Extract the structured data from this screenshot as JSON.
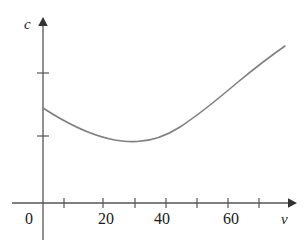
{
  "figure": {
    "width": 304,
    "height": 248,
    "background_color": "#ffffff",
    "axis_color": "#555555",
    "curve_color": "#808080",
    "text_color": "#1a1a1a"
  },
  "labels": {
    "y_axis": "c",
    "x_axis": "v",
    "origin": "0"
  },
  "chart_data": {
    "type": "line",
    "title": "",
    "subtitle": "",
    "xlabel": "v",
    "ylabel": "c",
    "grid": false,
    "legend": null,
    "xlim": [
      0,
      80
    ],
    "ylim": [
      0,
      5
    ],
    "x_ticks": [
      10,
      20,
      30,
      40,
      50,
      60,
      70
    ],
    "x_tick_labels": [
      "",
      "20",
      "",
      "40",
      "",
      "60",
      ""
    ],
    "x_labeled_ticks": [
      {
        "value": 20,
        "label": "20"
      },
      {
        "value": 40,
        "label": "40"
      },
      {
        "value": 60,
        "label": "60"
      }
    ],
    "y_ticks": [
      1,
      3
    ],
    "y_tick_labels": [
      "",
      ""
    ],
    "annotations": [],
    "series": [
      {
        "name": "cost",
        "description": "Fuel consumption c as a function of speed v: convex curve with a minimum near v = 30",
        "x": [
          0,
          5,
          10,
          15,
          20,
          25,
          30,
          35,
          40,
          45,
          50,
          55,
          60,
          65,
          70,
          75
        ],
        "y": [
          2.12,
          1.86,
          1.65,
          1.49,
          1.38,
          1.32,
          1.3,
          1.32,
          1.39,
          1.51,
          1.68,
          1.91,
          2.2,
          2.56,
          2.99,
          3.48
        ],
        "minimum": {
          "x": 30,
          "y": 1.3
        },
        "start_point": {
          "x": 0,
          "y": 2.12
        },
        "end_point": {
          "x": 75,
          "y": 3.48
        }
      }
    ]
  },
  "geometry": {
    "origin_px": {
      "x": 43,
      "y": 203
    },
    "x_axis_start_px": 12,
    "x_axis_end_px": 292,
    "y_axis_top_px": 20,
    "x_tick_px": [
      64,
      103,
      135,
      166,
      197,
      228,
      259
    ],
    "y_tick_px": [
      73,
      136
    ],
    "curve_path": "M 43,108 C 66,123 88,134 110,139 C 122,141.5 130,142 137,141.5 C 152,141 166,136 180,127 C 200,114 218,99 238,82 C 255,68 272,55 285,46"
  }
}
